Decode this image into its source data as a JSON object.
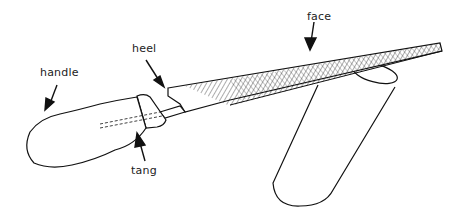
{
  "diagram": {
    "labels": [
      {
        "id": "handle",
        "text": "handle",
        "x": 40,
        "y": 66
      },
      {
        "id": "heel",
        "text": "heel",
        "x": 132,
        "y": 42
      },
      {
        "id": "face",
        "text": "face",
        "x": 307,
        "y": 10
      },
      {
        "id": "tang",
        "text": "tang",
        "x": 131,
        "y": 164
      }
    ],
    "colors": {
      "line": "#111111",
      "background": "#ffffff"
    }
  }
}
